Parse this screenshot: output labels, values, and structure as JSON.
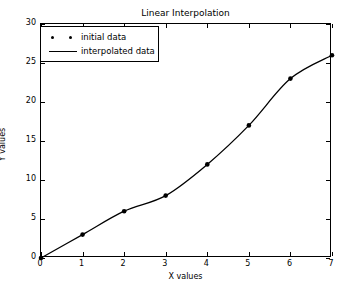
{
  "chart_data": {
    "type": "line",
    "title": "Linear Interpolation",
    "xlabel": "X values",
    "ylabel": "Y values",
    "xlim": [
      0,
      7
    ],
    "ylim": [
      0,
      30
    ],
    "xticks": [
      0,
      1,
      2,
      3,
      4,
      5,
      6,
      7
    ],
    "yticks": [
      0,
      5,
      10,
      15,
      20,
      25,
      30
    ],
    "grid": false,
    "legend_position": "upper left",
    "series": [
      {
        "name": "initial data",
        "style": "markers",
        "marker": "dot",
        "color": "#000000",
        "x": [
          0,
          1,
          2,
          3,
          4,
          5,
          6,
          7
        ],
        "values": [
          0,
          3,
          6,
          8,
          12,
          17,
          23,
          26
        ]
      },
      {
        "name": "interpolated data",
        "style": "line",
        "color": "#000000",
        "x": [
          0,
          1,
          2,
          3,
          4,
          5,
          6,
          7
        ],
        "values": [
          0,
          3,
          6,
          8,
          12,
          17,
          23,
          26
        ]
      }
    ]
  },
  "legend": {
    "entries": [
      {
        "label": "initial data",
        "key": "marker-dots"
      },
      {
        "label": "interpolated data",
        "key": "solid-line"
      }
    ]
  },
  "colors": {
    "axis": "#000000",
    "data": "#000000",
    "background": "#ffffff"
  }
}
